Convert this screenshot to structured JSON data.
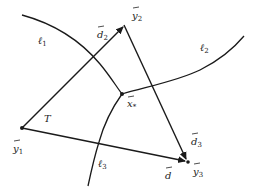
{
  "diagram": {
    "points": {
      "y1": {
        "label": "y",
        "sub": "1",
        "x": 22,
        "y": 128
      },
      "y2": {
        "label": "y",
        "sub": "2",
        "x": 124,
        "y": 25
      },
      "y3": {
        "label": "y",
        "sub": "3",
        "x": 188,
        "y": 162
      },
      "x_star": {
        "label": "x",
        "sub": "*",
        "x": 122,
        "y": 94
      }
    },
    "curves": {
      "l1": {
        "label": "ℓ",
        "sub": "1"
      },
      "l2": {
        "label": "ℓ",
        "sub": "2"
      },
      "l3": {
        "label": "ℓ",
        "sub": "3"
      }
    },
    "vectors": {
      "d2": {
        "label": "d",
        "sub": "2",
        "from": "y1",
        "to": "y2"
      },
      "d3": {
        "label": "d",
        "sub": "3",
        "from": "y2",
        "to": "y3"
      },
      "d": {
        "label": "d",
        "sub": "",
        "from": "y1",
        "to": "y3"
      }
    },
    "triangle_label": "T",
    "vector_mark": "→",
    "colors": {
      "stroke": "#1a1a1a",
      "background": "#ffffff"
    }
  }
}
